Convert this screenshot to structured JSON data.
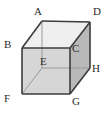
{
  "figure": {
    "name": "labeled-cube-diagram",
    "background_color": "#ffffff",
    "edge_color": "#3c3c3c",
    "hidden_edge_color": "#9a9a9a",
    "face_colors": {
      "top": "#efefef",
      "front": "#d6d6d6",
      "right": "#b9b9b9"
    },
    "edge_width": 1.6,
    "hidden_edge_width": 1.0
  },
  "vertices": [
    {
      "label": "A",
      "role": "top-back-left",
      "point_x": 42,
      "point_y": 21,
      "label_x": 34,
      "label_y": 6
    },
    {
      "label": "D",
      "role": "top-back-right",
      "point_x": 90,
      "point_y": 22,
      "label_x": 93,
      "label_y": 6
    },
    {
      "label": "B",
      "role": "top-front-left",
      "point_x": 22,
      "point_y": 48,
      "label_x": 4,
      "label_y": 39
    },
    {
      "label": "C",
      "role": "top-front-right",
      "point_x": 70,
      "point_y": 48,
      "label_x": 72,
      "label_y": 43
    },
    {
      "label": "E",
      "role": "bottom-back-left",
      "point_x": 42,
      "point_y": 68,
      "label_x": 40,
      "label_y": 56
    },
    {
      "label": "H",
      "role": "bottom-back-right",
      "point_x": 90,
      "point_y": 68,
      "label_x": 92,
      "label_y": 63
    },
    {
      "label": "F",
      "role": "bottom-front-left",
      "point_x": 22,
      "point_y": 94,
      "label_x": 4,
      "label_y": 93
    },
    {
      "label": "G",
      "role": "bottom-front-right",
      "point_x": 70,
      "point_y": 94,
      "label_x": 72,
      "label_y": 96
    }
  ],
  "edges": [
    {
      "name": "edge-A-D",
      "from": "A",
      "to": "D",
      "hidden": false
    },
    {
      "name": "edge-A-B",
      "from": "A",
      "to": "B",
      "hidden": false
    },
    {
      "name": "edge-D-C",
      "from": "D",
      "to": "C",
      "hidden": false
    },
    {
      "name": "edge-B-C",
      "from": "B",
      "to": "C",
      "hidden": false
    },
    {
      "name": "edge-D-H",
      "from": "D",
      "to": "H",
      "hidden": false
    },
    {
      "name": "edge-C-G",
      "from": "C",
      "to": "G",
      "hidden": false
    },
    {
      "name": "edge-B-F",
      "from": "B",
      "to": "F",
      "hidden": false
    },
    {
      "name": "edge-F-G",
      "from": "F",
      "to": "G",
      "hidden": false
    },
    {
      "name": "edge-G-H",
      "from": "G",
      "to": "H",
      "hidden": false
    },
    {
      "name": "edge-A-E",
      "from": "A",
      "to": "E",
      "hidden": true
    },
    {
      "name": "edge-E-F",
      "from": "E",
      "to": "F",
      "hidden": true
    },
    {
      "name": "edge-E-H",
      "from": "E",
      "to": "H",
      "hidden": true
    }
  ],
  "faces": [
    {
      "name": "face-top",
      "points": "42,21 90,22 70,48 22,48",
      "fill_key": "top"
    },
    {
      "name": "face-front",
      "points": "22,48 70,48 70,94 22,94",
      "fill_key": "front"
    },
    {
      "name": "face-right",
      "points": "70,48 90,22 90,68 70,94",
      "fill_key": "right"
    }
  ]
}
